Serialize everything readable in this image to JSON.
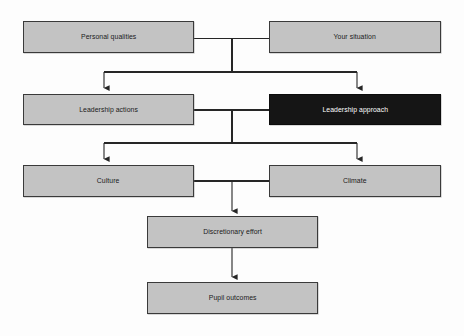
{
  "diagram": {
    "background_color": "#fdfdfd",
    "box_fill": "#c3c3c3",
    "box_fill_highlight": "#151515",
    "box_border": "#3a3a3a",
    "text_color": "#1a1a1a",
    "text_color_highlight": "#ffffff",
    "line_color": "#262626",
    "nodes": [
      {
        "id": "personal-qualities",
        "label": "Personal qualities",
        "highlighted": false,
        "x": 23,
        "y": 21,
        "w": 171,
        "h": 32
      },
      {
        "id": "your-situation",
        "label": "Your situation",
        "highlighted": false,
        "x": 269,
        "y": 21,
        "w": 172,
        "h": 32
      },
      {
        "id": "leadership-actions",
        "label": "Leadership actions",
        "highlighted": false,
        "x": 23,
        "y": 94,
        "w": 171,
        "h": 31
      },
      {
        "id": "leadership-approach",
        "label": "Leadership approach",
        "highlighted": true,
        "x": 269,
        "y": 94,
        "w": 172,
        "h": 31
      },
      {
        "id": "culture",
        "label": "Culture",
        "highlighted": false,
        "x": 23,
        "y": 165,
        "w": 171,
        "h": 32
      },
      {
        "id": "climate",
        "label": "Climate",
        "highlighted": false,
        "x": 269,
        "y": 165,
        "w": 172,
        "h": 32
      },
      {
        "id": "discretionary-effort",
        "label": "Discretionary effort",
        "highlighted": false,
        "x": 147,
        "y": 216,
        "w": 171,
        "h": 32
      },
      {
        "id": "pupil-outcomes",
        "label": "Pupil outcomes",
        "highlighted": false,
        "x": 147,
        "y": 282,
        "w": 171,
        "h": 32
      }
    ],
    "connectors": [
      {
        "id": "row1-join",
        "from": "personal-qualities",
        "to": "your-situation",
        "kind": "horizontal-join"
      },
      {
        "id": "row1-split",
        "from": "row1-join",
        "to": "leadership-actions",
        "kind": "split-arrow"
      },
      {
        "id": "row1-split-right",
        "from": "row1-join",
        "to": "leadership-approach",
        "kind": "split-arrow"
      },
      {
        "id": "row2-join",
        "from": "leadership-actions",
        "to": "leadership-approach",
        "kind": "horizontal-join"
      },
      {
        "id": "row2-split-left",
        "from": "row2-join",
        "to": "culture",
        "kind": "split-arrow"
      },
      {
        "id": "row2-split-right",
        "from": "row2-join",
        "to": "climate",
        "kind": "split-arrow"
      },
      {
        "id": "row3-join",
        "from": "culture",
        "to": "climate",
        "kind": "horizontal-join"
      },
      {
        "id": "to-discretionary",
        "from": "row3-join",
        "to": "discretionary-effort",
        "kind": "arrow"
      },
      {
        "id": "to-pupil",
        "from": "discretionary-effort",
        "to": "pupil-outcomes",
        "kind": "arrow"
      }
    ]
  }
}
